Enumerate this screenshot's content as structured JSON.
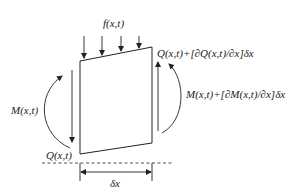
{
  "diagram": {
    "type": "beam-element-free-body",
    "labels": {
      "load": "f(x,t)",
      "shear_left": "Q(x,t)",
      "shear_right": "Q(x,t)+[∂Q(x,t)/∂x]δx",
      "moment_left": "M(x,t)",
      "moment_right": "M(x,t)+[∂M(x,t)/∂x]δx",
      "length": "δx"
    },
    "colors": {
      "stroke": "#222222",
      "background": "#ffffff"
    },
    "load_arrow_count": 4
  }
}
